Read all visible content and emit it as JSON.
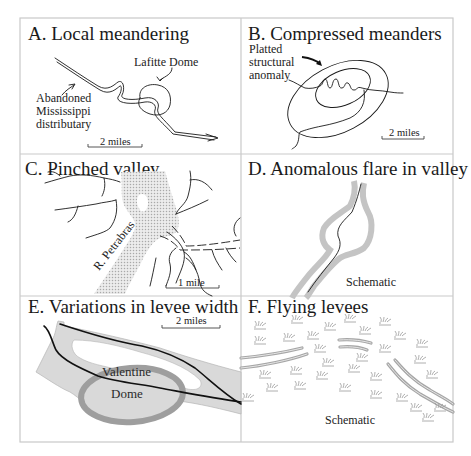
{
  "figure": {
    "panels": [
      {
        "id": "A",
        "title": "A.  Local meandering",
        "labels": {
          "feature": "Lafitte  Dome",
          "river_line1": "Abandoned",
          "river_line2": "Mississippi",
          "river_line3": "distributary"
        },
        "scale_bar": "2 miles"
      },
      {
        "id": "B",
        "title": "B.  Compressed meanders",
        "labels": {
          "anomaly_line1": "Platted",
          "anomaly_line2": "structural",
          "anomaly_line3": "anomaly"
        },
        "scale_bar": "2 miles"
      },
      {
        "id": "C",
        "title": "C.  Pinched valley",
        "labels": {
          "river": "R. Petrabras"
        },
        "scale_bar": "1 mile"
      },
      {
        "id": "D",
        "title": "D.  Anomalous flare in valley",
        "labels": {
          "note": "Schematic"
        }
      },
      {
        "id": "E",
        "title": "E.  Variations in levee width",
        "labels": {
          "dome_line1": "Valentine",
          "dome_line2": "Dome"
        },
        "scale_bar": "2 miles"
      },
      {
        "id": "F",
        "title": "F.  Flying levees",
        "labels": {
          "note": "Schematic"
        },
        "symbol": "marsh-grass"
      }
    ]
  },
  "colors": {
    "frame": "#c9c9c9",
    "ink": "#1a1a1a",
    "levee_fill": "#d9d9d9",
    "levee_dark": "#a8a8a8",
    "valley_stipple": "#bdbdbd",
    "marsh": "#9a9a9a"
  }
}
